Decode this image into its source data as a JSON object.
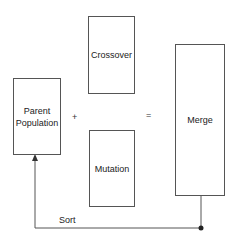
{
  "diagram": {
    "nodes": {
      "parent": {
        "label": "Parent Population"
      },
      "crossover": {
        "label": "Crossover"
      },
      "mutation": {
        "label": "Mutation"
      },
      "merge": {
        "label": "Merge"
      }
    },
    "operators": {
      "plus": "+",
      "equals": "="
    },
    "edges": [
      {
        "from": "merge",
        "to": "parent",
        "label": "Sort"
      }
    ],
    "colors": {
      "stroke": "#555555",
      "text": "#222222",
      "background": "#ffffff"
    }
  }
}
